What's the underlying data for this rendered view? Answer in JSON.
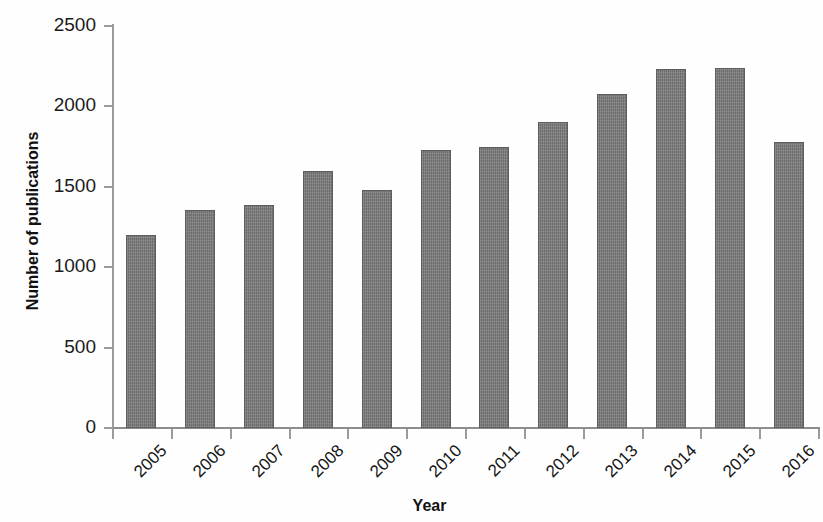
{
  "chart_data": {
    "type": "bar",
    "title": "",
    "subtitle": "",
    "xlabel": "Year",
    "ylabel": "Number of publications",
    "categories": [
      "2005",
      "2006",
      "2007",
      "2008",
      "2009",
      "2010",
      "2011",
      "2012",
      "2013",
      "2014",
      "2015",
      "2016"
    ],
    "values": [
      1200,
      1355,
      1390,
      1600,
      1480,
      1730,
      1745,
      1900,
      2080,
      2230,
      2240,
      1780
    ],
    "series": [
      {
        "name": "Number of publications",
        "values": [
          1200,
          1355,
          1390,
          1600,
          1480,
          1730,
          1745,
          1900,
          2080,
          2230,
          2240,
          1780
        ]
      }
    ],
    "ylim": [
      0,
      2500
    ],
    "y_ticks": [
      0,
      500,
      1000,
      1500,
      2000,
      2500
    ],
    "y_tick_labels": [
      "0",
      "500",
      "1000",
      "1500",
      "2000",
      "2500"
    ],
    "x_tick_labels": [
      "2005",
      "2006",
      "2007",
      "2008",
      "2009",
      "2010",
      "2011",
      "2012",
      "2013",
      "2014",
      "2015",
      "2016"
    ],
    "grid": false,
    "legend": false,
    "legend_position": "none",
    "bar_color": "#7b7b7b",
    "bar_border_color": "#5e5e5e",
    "axis_color": "#9b9b9b",
    "background_color": "#ffffff",
    "x_tick_label_rotation": -45,
    "annotations": []
  },
  "axes": {
    "y_title": "Number of publications",
    "x_title": "Year"
  }
}
